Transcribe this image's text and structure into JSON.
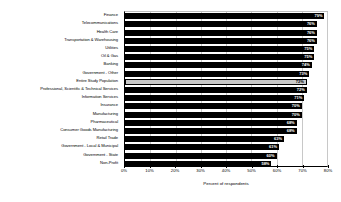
{
  "chart_data": {
    "type": "bar",
    "orientation": "horizontal",
    "title": "",
    "xlabel": "Percent of respondents",
    "ylabel": "",
    "xlim": [
      0,
      80
    ],
    "xticks": [
      "0%",
      "10%",
      "20%",
      "30%",
      "40%",
      "50%",
      "60%",
      "70%",
      "80%"
    ],
    "xtick_values": [
      0,
      10,
      20,
      30,
      40,
      50,
      60,
      70,
      80
    ],
    "grid": true,
    "legend": "none",
    "highlight_category": "Entire Study Population",
    "colors": {
      "bar": "#000000",
      "highlight_bar": "#c9c9c9",
      "value_label": "#ffffff",
      "highlight_value_label": "#000000",
      "gridline": "#c8c8c8",
      "axis": "#000000",
      "background": "#ffffff"
    },
    "categories": [
      "Finance",
      "Telecommunications",
      "Health Care",
      "Transportation & Warehousing",
      "Utilities",
      "Oil & Gas",
      "Banking",
      "Government - Other",
      "Entire Study Population",
      "Professional, Scientific & Technical Services",
      "Information Services",
      "Insurance",
      "Manufacturing",
      "Pharmaceutical",
      "Consumer Goods Manufacturing",
      "Retail Trade",
      "Government - Local & Municipal",
      "Government - State",
      "Non-Profit"
    ],
    "values": [
      79,
      76,
      76,
      76,
      75,
      75,
      74,
      73,
      72,
      72,
      71,
      70,
      70,
      68,
      68,
      63,
      61,
      60,
      58
    ],
    "value_labels": [
      "79%",
      "76%",
      "76%",
      "76%",
      "75%",
      "75%",
      "74%",
      "73%",
      "72%",
      "72%",
      "71%",
      "70%",
      "70%",
      "68%",
      "68%",
      "63%",
      "61%",
      "60%",
      "58%"
    ]
  }
}
